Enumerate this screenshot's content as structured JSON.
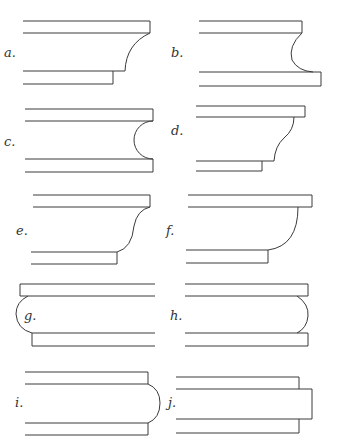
{
  "figure": {
    "panels": [
      {
        "id": "a",
        "label": "a."
      },
      {
        "id": "b",
        "label": "b."
      },
      {
        "id": "c",
        "label": "c."
      },
      {
        "id": "d",
        "label": "d."
      },
      {
        "id": "e",
        "label": "e."
      },
      {
        "id": "f",
        "label": "f."
      },
      {
        "id": "g",
        "label": "g."
      },
      {
        "id": "h",
        "label": "h."
      },
      {
        "id": "i",
        "label": "i."
      },
      {
        "id": "j",
        "label": "j."
      }
    ],
    "line_color": "#3a3a3a",
    "background": "#ffffff"
  }
}
